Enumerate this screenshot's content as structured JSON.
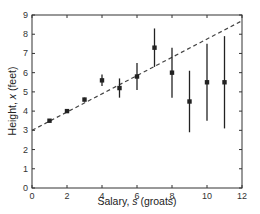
{
  "chart_data": {
    "type": "scatter",
    "title": "",
    "xlabel": "Salary,",
    "xlabel_var": "s",
    "xlabel_unit": "(groats)",
    "ylabel": "Height,",
    "ylabel_var": "x",
    "ylabel_unit": "(feet)",
    "xlim": [
      0,
      12
    ],
    "ylim": [
      0,
      9
    ],
    "xticks": [
      0,
      2,
      4,
      6,
      8,
      10,
      12
    ],
    "yticks": [
      0,
      1,
      2,
      3,
      4,
      5,
      6,
      7,
      8,
      9
    ],
    "grid": false,
    "legend": null,
    "series": [
      {
        "name": "data",
        "marker": "square",
        "color": "#222222",
        "x": [
          1,
          2,
          3,
          4,
          5,
          6,
          7,
          8,
          9,
          10,
          11
        ],
        "y": [
          3.5,
          4.0,
          4.6,
          5.6,
          5.2,
          5.8,
          7.3,
          6.0,
          4.5,
          5.5,
          5.5
        ],
        "yerr": [
          0.05,
          0.05,
          0.1,
          0.3,
          0.5,
          0.7,
          1.0,
          1.3,
          1.6,
          2.0,
          2.4
        ]
      },
      {
        "name": "fit",
        "style": "dashed",
        "color": "#444444",
        "x": [
          0,
          12
        ],
        "y": [
          3.0,
          8.7
        ]
      }
    ]
  }
}
